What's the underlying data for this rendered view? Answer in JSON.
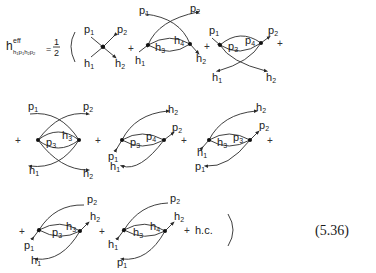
{
  "equation": {
    "lhs": {
      "symbol": "h",
      "superscript": "eff",
      "subscript": "h1p1h2p2"
    },
    "prefactor_numerator": "1",
    "prefactor_denominator": "2",
    "open_paren": "(",
    "close_paren": ")",
    "plus": "+",
    "hermitian_conjugate": "h.c.",
    "equation_number": "(5.36)"
  },
  "diagrams": [
    {
      "id": 1,
      "row": 1,
      "type": "4-point vertex",
      "labels": [
        "p1",
        "p2",
        "h1",
        "h2"
      ]
    },
    {
      "id": 2,
      "row": 1,
      "type": "two-vertex, hole loop",
      "external": [
        "p1",
        "p2",
        "h1",
        "h2"
      ],
      "internal": [
        "h3",
        "h4"
      ]
    },
    {
      "id": 3,
      "row": 1,
      "type": "two-vertex, particle loop",
      "external": [
        "p1",
        "p2",
        "h1",
        "h2"
      ],
      "internal": [
        "p3",
        "p4"
      ]
    },
    {
      "id": 4,
      "row": 2,
      "type": "two-vertex, particle-hole",
      "external": [
        "p1",
        "p2",
        "h1",
        "h2"
      ],
      "internal": [
        "p3",
        "h3"
      ]
    },
    {
      "id": 5,
      "row": 2,
      "type": "two-vertex, particle loop",
      "external": [
        "h2",
        "p2",
        "p1",
        "h1"
      ],
      "internal": [
        "p3",
        "p4"
      ]
    },
    {
      "id": 6,
      "row": 2,
      "type": "two-vertex, particle-hole",
      "external": [
        "h2",
        "p2",
        "h1",
        "p1"
      ],
      "internal": [
        "h3",
        "p3"
      ]
    },
    {
      "id": 7,
      "row": 3,
      "type": "two-vertex, particle-hole",
      "external": [
        "p2",
        "h2",
        "p1",
        "h1"
      ],
      "internal": [
        "p3",
        "h3"
      ]
    },
    {
      "id": 8,
      "row": 3,
      "type": "two-vertex, hole loop",
      "external": [
        "p2",
        "h2",
        "h1",
        "p1"
      ],
      "internal": [
        "h3",
        "h4"
      ]
    }
  ],
  "labels": {
    "d1": {
      "tl": "p",
      "tl_s": "1",
      "tr": "p",
      "tr_s": "2",
      "bl": "h",
      "bl_s": "1",
      "br": "h",
      "br_s": "2"
    },
    "d2": {
      "tl": "p",
      "tl_s": "1",
      "tr": "p",
      "tr_s": "2",
      "in1": "h",
      "in1_s": "3",
      "in2": "h",
      "in2_s": "4",
      "bl": "h",
      "bl_s": "1",
      "br": "h",
      "br_s": "2"
    },
    "d3": {
      "tl": "p",
      "tl_s": "1",
      "tr": "p",
      "tr_s": "2",
      "in1": "p",
      "in1_s": "3",
      "in2": "p",
      "in2_s": "4",
      "bl": "h",
      "bl_s": "1",
      "br": "h",
      "br_s": "2"
    },
    "d4": {
      "tl": "p",
      "tl_s": "1",
      "tr": "p",
      "tr_s": "2",
      "in1": "p",
      "in1_s": "3",
      "in2": "h",
      "in2_s": "3",
      "bl": "h",
      "bl_s": "1",
      "br": "h",
      "br_s": "2"
    },
    "d5": {
      "top": "h",
      "top_s": "2",
      "right": "p",
      "right_s": "2",
      "in1": "p",
      "in1_s": "3",
      "in2": "p",
      "in2_s": "4",
      "left": "p",
      "left_s": "1",
      "bottom": "h",
      "bottom_s": "1"
    },
    "d6": {
      "top": "h",
      "top_s": "2",
      "right": "p",
      "right_s": "2",
      "in1": "h",
      "in1_s": "3",
      "in2": "p",
      "in2_s": "3",
      "left": "h",
      "left_s": "1",
      "bottom": "p",
      "bottom_s": "1"
    },
    "d7": {
      "top": "p",
      "top_s": "2",
      "right": "h",
      "right_s": "2",
      "in1": "p",
      "in1_s": "3",
      "in2": "h",
      "in2_s": "3",
      "left": "p",
      "left_s": "1",
      "bottom": "h",
      "bottom_s": "1"
    },
    "d8": {
      "top": "p",
      "top_s": "2",
      "right": "h",
      "right_s": "2",
      "in1": "h",
      "in1_s": "3",
      "in2": "h",
      "in2_s": "4",
      "left": "h",
      "left_s": "1",
      "bottom": "p",
      "bottom_s": "1"
    }
  }
}
